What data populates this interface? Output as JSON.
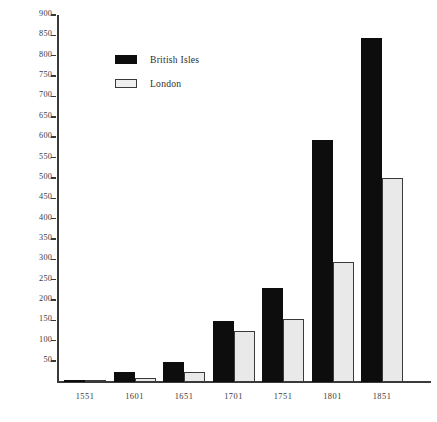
{
  "chart_data": {
    "type": "bar",
    "title": "",
    "subtitle": "",
    "xlabel": "",
    "ylabel": "",
    "categories": [
      "1551",
      "1601",
      "1651",
      "1701",
      "1751",
      "1801",
      "1851"
    ],
    "series": [
      {
        "name": "British Isles",
        "color": "#0d0d0d",
        "values": [
          3,
          25,
          50,
          150,
          230,
          595,
          845
        ]
      },
      {
        "name": "London",
        "color": "#e9e9e9",
        "values": [
          1,
          10,
          25,
          125,
          155,
          295,
          500
        ]
      }
    ],
    "ylim": [
      0,
      900
    ],
    "yticks": [
      900,
      850,
      800,
      750,
      700,
      650,
      600,
      550,
      500,
      450,
      400,
      350,
      300,
      250,
      200,
      150,
      100,
      50
    ],
    "ytick_labels": [
      "900",
      "850",
      "800",
      "750",
      "700",
      "650",
      "600",
      "550",
      "500",
      "450",
      "400",
      "350",
      "300",
      "250",
      "200",
      "150",
      "100",
      "50"
    ],
    "grid": false,
    "legend_position": "upper-left-inside",
    "axis_color": "#3a3a38",
    "background_color": "#ffffff"
  },
  "legend": {
    "entries": [
      {
        "label": "British Isles",
        "swatch": "filled-black"
      },
      {
        "label": "London",
        "swatch": "outlined-white"
      }
    ]
  }
}
